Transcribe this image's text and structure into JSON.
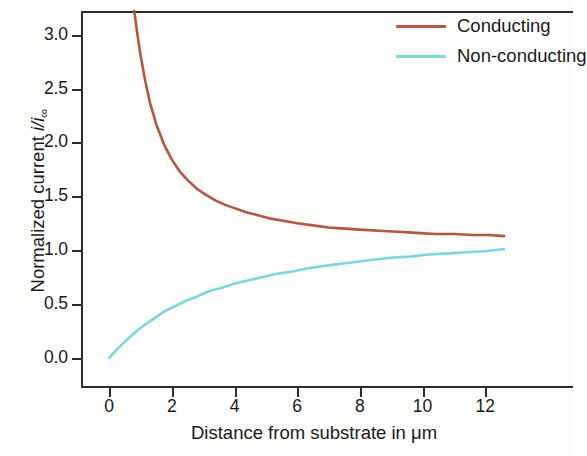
{
  "figure": {
    "background_color": "#ffffff",
    "axis_color": "#2b2b2b"
  },
  "chart_data": {
    "type": "line",
    "title": "",
    "xlabel": "Distance from substrate in μm",
    "ylabel": "Normalized current i/i∞",
    "ylabel_parts": {
      "prefix": "Normalized current ",
      "numerator": "i",
      "slash": "/",
      "denominator": "i",
      "subscript": "∞"
    },
    "xlim": [
      -0.9,
      14.8
    ],
    "ylim": [
      -0.28,
      3.22
    ],
    "xticks": [
      0,
      2,
      4,
      6,
      8,
      10,
      12
    ],
    "xtick_labels": [
      "0",
      "2",
      "4",
      "6",
      "8",
      "10",
      "12"
    ],
    "yticks": [
      0.0,
      0.5,
      1.0,
      1.5,
      2.0,
      2.5,
      3.0
    ],
    "ytick_labels": [
      "0.0",
      "0.5",
      "1.0",
      "1.5",
      "2.0",
      "2.5",
      "3.0"
    ],
    "grid": false,
    "legend_position": "top-right",
    "series": [
      {
        "name": "Conducting",
        "color": "#b5553f",
        "line_width": 2.6,
        "x": [
          0.8,
          0.9,
          1.0,
          1.15,
          1.3,
          1.5,
          1.75,
          2.0,
          2.25,
          2.5,
          2.8,
          3.1,
          3.4,
          3.7,
          4.0,
          4.4,
          4.8,
          5.2,
          5.6,
          6.0,
          6.5,
          7.0,
          7.5,
          8.0,
          8.6,
          9.2,
          9.8,
          10.4,
          11.0,
          11.6,
          12.1,
          12.6
        ],
        "y": [
          3.22,
          3.0,
          2.81,
          2.57,
          2.37,
          2.17,
          1.98,
          1.84,
          1.73,
          1.65,
          1.57,
          1.51,
          1.46,
          1.42,
          1.39,
          1.35,
          1.32,
          1.29,
          1.27,
          1.25,
          1.23,
          1.21,
          1.2,
          1.19,
          1.18,
          1.17,
          1.16,
          1.15,
          1.15,
          1.14,
          1.14,
          1.13
        ]
      },
      {
        "name": "Non-conducting",
        "color": "#7ad7e0",
        "line_width": 2.6,
        "x": [
          0.0,
          0.25,
          0.5,
          0.8,
          1.1,
          1.4,
          1.75,
          2.1,
          2.45,
          2.8,
          3.2,
          3.6,
          4.0,
          4.45,
          4.9,
          5.35,
          5.8,
          6.3,
          6.8,
          7.3,
          7.85,
          8.4,
          9.0,
          9.6,
          10.2,
          10.8,
          11.4,
          12.0,
          12.6
        ],
        "y": [
          0.0,
          0.08,
          0.15,
          0.23,
          0.3,
          0.36,
          0.43,
          0.48,
          0.53,
          0.57,
          0.62,
          0.65,
          0.69,
          0.72,
          0.75,
          0.78,
          0.8,
          0.83,
          0.85,
          0.87,
          0.89,
          0.91,
          0.93,
          0.94,
          0.96,
          0.97,
          0.98,
          0.99,
          1.01
        ]
      }
    ],
    "legend": [
      {
        "label": "Conducting",
        "color": "#b5553f"
      },
      {
        "label": "Non-conducting",
        "color": "#7ad7e0"
      }
    ]
  }
}
